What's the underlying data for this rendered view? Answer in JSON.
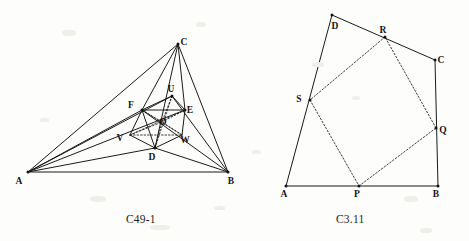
{
  "page": {
    "width": 469,
    "height": 241,
    "background_color": "#fdfdfb",
    "ink_color": "#1a1a1a"
  },
  "figures": [
    {
      "id": "left",
      "caption": "C49-1",
      "caption_position": {
        "x": 126,
        "y": 213
      },
      "outline": "Large triangle A B C with interior cevian-like segments to an inner hexagonal/quadrilateral cluster of points D E F U V W, plus fine dotted construction lines near the centre.",
      "points": {
        "A": {
          "x": 28,
          "y": 172,
          "label": "A",
          "label_dx": -9,
          "label_dy": 12
        },
        "B": {
          "x": 228,
          "y": 172,
          "label": "B",
          "label_dx": 3,
          "label_dy": 12
        },
        "C": {
          "x": 178,
          "y": 44,
          "label": "C",
          "label_dx": 6,
          "label_dy": 1
        },
        "D": {
          "x": 155,
          "y": 148,
          "label": "D",
          "label_dx": -3,
          "label_dy": 12
        },
        "E": {
          "x": 185,
          "y": 110,
          "label": "E",
          "label_dx": 5,
          "label_dy": 3
        },
        "F": {
          "x": 142,
          "y": 110,
          "label": "F",
          "label_dx": -11,
          "label_dy": -2
        },
        "U": {
          "x": 172,
          "y": 96,
          "label": "U",
          "label_dx": -1,
          "label_dy": -4
        },
        "V": {
          "x": 130,
          "y": 135,
          "label": "V",
          "label_dx": -10,
          "label_dy": 6
        },
        "W": {
          "x": 182,
          "y": 135,
          "label": "W",
          "label_dx": 3,
          "label_dy": 8
        },
        "O": {
          "x": 162,
          "y": 122,
          "label": "O",
          "label_dx": 1,
          "label_dy": 3
        }
      },
      "solid_segments": [
        [
          "A",
          "B"
        ],
        [
          "A",
          "C"
        ],
        [
          "B",
          "C"
        ],
        [
          "A",
          "D"
        ],
        [
          "A",
          "E"
        ],
        [
          "A",
          "F"
        ],
        [
          "A",
          "U"
        ],
        [
          "B",
          "D"
        ],
        [
          "B",
          "F"
        ],
        [
          "B",
          "U"
        ],
        [
          "C",
          "D"
        ],
        [
          "C",
          "F"
        ],
        [
          "C",
          "E"
        ],
        [
          "F",
          "U"
        ],
        [
          "U",
          "E"
        ],
        [
          "E",
          "W"
        ],
        [
          "W",
          "D"
        ],
        [
          "D",
          "V"
        ],
        [
          "V",
          "F"
        ],
        [
          "F",
          "D"
        ],
        [
          "F",
          "E"
        ]
      ],
      "dotted_segments": [
        [
          "F",
          "W"
        ],
        [
          "E",
          "V"
        ],
        [
          "U",
          "D"
        ],
        [
          "V",
          "W"
        ],
        [
          "F",
          "O"
        ],
        [
          "E",
          "O"
        ],
        [
          "D",
          "O"
        ],
        [
          "U",
          "O"
        ],
        [
          "V",
          "O"
        ],
        [
          "W",
          "O"
        ]
      ],
      "vertex_dots": [
        "C",
        "D",
        "E",
        "F",
        "U",
        "A",
        "B"
      ]
    },
    {
      "id": "right",
      "caption": "C3.11",
      "caption_position": {
        "x": 336,
        "y": 213
      },
      "outline": "Convex quadrilateral A B C D with an inscribed dotted quadrilateral P Q R S whose vertices lie on the four sides.",
      "points": {
        "A": {
          "x": 286,
          "y": 186,
          "label": "A",
          "label_dx": -2,
          "label_dy": 11
        },
        "B": {
          "x": 438,
          "y": 186,
          "label": "B",
          "label_dx": -2,
          "label_dy": 11
        },
        "C": {
          "x": 435,
          "y": 60,
          "label": "C",
          "label_dx": 6,
          "label_dy": 3
        },
        "D": {
          "x": 332,
          "y": 15,
          "label": "D",
          "label_dx": 3,
          "label_dy": 14
        },
        "P": {
          "x": 359,
          "y": 186,
          "label": "P",
          "label_dx": -2,
          "label_dy": 11
        },
        "Q": {
          "x": 436,
          "y": 128,
          "label": "Q",
          "label_dx": 7,
          "label_dy": 5
        },
        "R": {
          "x": 385,
          "y": 37,
          "label": "R",
          "label_dx": -2,
          "label_dy": -4
        },
        "S": {
          "x": 310,
          "y": 100,
          "label": "S",
          "label_dx": -11,
          "label_dy": 2
        }
      },
      "solid_segments": [
        [
          "A",
          "B"
        ],
        [
          "B",
          "C"
        ],
        [
          "C",
          "D"
        ],
        [
          "D",
          "A"
        ]
      ],
      "dotted_segments": [
        [
          "P",
          "Q"
        ],
        [
          "Q",
          "R"
        ],
        [
          "R",
          "S"
        ],
        [
          "S",
          "P"
        ]
      ],
      "vertex_dots": [
        "A",
        "B",
        "C",
        "D",
        "P",
        "Q",
        "R",
        "S"
      ]
    }
  ]
}
